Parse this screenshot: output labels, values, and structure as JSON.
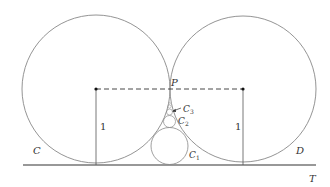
{
  "diagram": {
    "labels": {
      "circle_left": "C",
      "circle_right": "D",
      "tangent_point": "P",
      "tangent_line": "T",
      "radius_left": "1",
      "radius_right": "1",
      "small_circle_1": "C",
      "small_circle_1_sub": "1",
      "small_circle_2": "C",
      "small_circle_2_sub": "2",
      "small_circle_3": "C",
      "small_circle_3_sub": "3"
    },
    "colors": {
      "stroke": "#777777",
      "line": "#333333",
      "text": "#333333"
    }
  }
}
